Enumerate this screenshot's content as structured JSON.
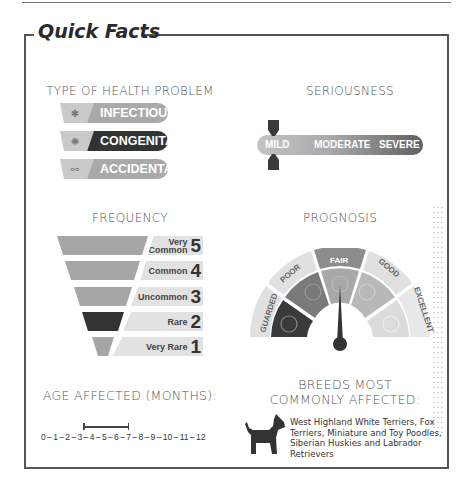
{
  "title": "Quick Facts",
  "health_problem": {
    "heading": "TYPE OF HEALTH PROBLEM",
    "items": [
      {
        "label": "INFECTIOUS",
        "icon": "virus-icon",
        "selected": false,
        "color": "#a9a9a9"
      },
      {
        "label": "CONGENITAL",
        "icon": "brain-icon",
        "selected": true,
        "color": "#333333"
      },
      {
        "label": "ACCIDENTAL",
        "icon": "bone-icon",
        "selected": false,
        "color": "#a9a9a9"
      }
    ]
  },
  "seriousness": {
    "heading": "SERIOUSNESS",
    "levels": [
      "MILD",
      "MODERATE",
      "SEVERE"
    ],
    "selected": "MILD"
  },
  "frequency": {
    "heading": "FREQUENCY",
    "levels": [
      {
        "label_line1": "Very",
        "label_line2": "Common",
        "number": "5",
        "selected": false
      },
      {
        "label_line1": "",
        "label_line2": "Common",
        "number": "4",
        "selected": false
      },
      {
        "label_line1": "",
        "label_line2": "Uncommon",
        "number": "3",
        "selected": false
      },
      {
        "label_line1": "",
        "label_line2": "Rare",
        "number": "2",
        "selected": true
      },
      {
        "label_line1": "",
        "label_line2": "Very Rare",
        "number": "1",
        "selected": false
      }
    ]
  },
  "prognosis": {
    "heading": "PROGNOSIS",
    "levels": [
      "GUARDED",
      "POOR",
      "FAIR",
      "GOOD",
      "EXCELLENT"
    ],
    "selected": "FAIR"
  },
  "age": {
    "heading": "AGE AFFECTED (MONTHS):",
    "scale": "0 – 1 – 2 – 3 – 4 – 5 – 6 – 7 – 8 – 9 – 10 – 11 – 12",
    "range_start": 3,
    "range_end": 6
  },
  "breeds": {
    "heading_line1": "BREEDS MOST",
    "heading_line2": "COMMONLY AFFECTED:",
    "text": "West Highland White Terriers, Fox Terriers, Miniature and Toy Poodles, Siberian Huskies and Labrador Retrievers",
    "icon": "dog-icon"
  }
}
